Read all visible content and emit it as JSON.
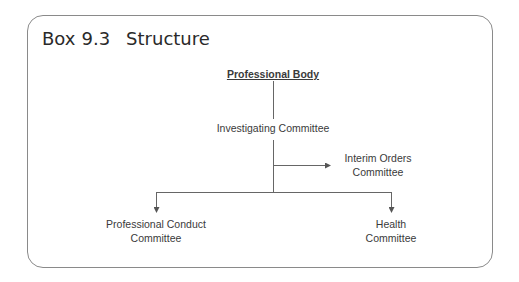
{
  "box": {
    "label": "Box",
    "number": "9.3",
    "title": "Structure"
  },
  "diagram": {
    "type": "org-chart",
    "nodes": [
      {
        "id": "root",
        "lines": [
          "Professional Body"
        ]
      },
      {
        "id": "investigating",
        "lines": [
          "Investigating Committee"
        ]
      },
      {
        "id": "interim",
        "lines": [
          "Interim Orders",
          "Committee"
        ]
      },
      {
        "id": "conduct",
        "lines": [
          "Professional Conduct",
          "Committee"
        ]
      },
      {
        "id": "health",
        "lines": [
          "Health",
          "Committee"
        ]
      }
    ],
    "edges": [
      {
        "from": "root",
        "to": "investigating",
        "arrow": false
      },
      {
        "from": "investigating",
        "to": "interim",
        "arrow": true
      },
      {
        "from": "investigating",
        "to": "conduct",
        "arrow": true
      },
      {
        "from": "investigating",
        "to": "health",
        "arrow": true
      }
    ]
  },
  "colors": {
    "line": "#555555",
    "frame": "#8a8a8a",
    "text": "#3a3a3a"
  }
}
